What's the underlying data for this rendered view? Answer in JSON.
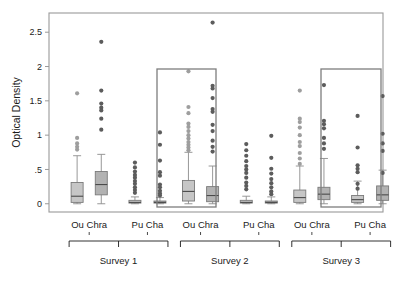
{
  "chart_data": {
    "type": "box",
    "title": "",
    "xlabel": "",
    "ylabel": "Optical Density",
    "ylim": [
      -0.12,
      2.78
    ],
    "yticks": [
      0,
      0.5,
      1,
      1.5,
      2,
      2.5
    ],
    "ytick_labels": [
      "0",
      ".5",
      "1",
      "1.5",
      "2",
      "2.5"
    ],
    "grid": false,
    "legend": "none",
    "group_labels": [
      "Ou Chra",
      "Pu Cha"
    ],
    "panel_labels": [
      "Survey 1",
      "Survey 2",
      "Survey 3"
    ],
    "highlight_boxes": [
      {
        "panel": "Survey 2",
        "group": "Ou Chra",
        "x0": 157,
        "y0": 69,
        "x1": 216,
        "y1": 207
      },
      {
        "panel": "Survey 3",
        "group": "Pu Cha",
        "x0": 321,
        "y0": 69,
        "x1": 381,
        "y1": 207
      }
    ],
    "series": [
      {
        "name": "Survey 1 / Ou Chra / A",
        "panel": "Survey 1",
        "group": "Ou Chra",
        "index": 0,
        "q1": 0.02,
        "median": 0.11,
        "q3": 0.31,
        "whisker_low": 0.0,
        "whisker_high": 0.7,
        "outliers": [
          1.61,
          0.96,
          0.88,
          0.83,
          0.79
        ]
      },
      {
        "name": "Survey 1 / Ou Chra / B",
        "panel": "Survey 1",
        "group": "Ou Chra",
        "index": 1,
        "q1": 0.13,
        "median": 0.28,
        "q3": 0.47,
        "whisker_low": 0.0,
        "whisker_high": 0.72,
        "outliers": [
          2.36,
          1.65,
          1.46,
          1.4,
          1.36,
          1.24,
          1.08
        ]
      },
      {
        "name": "Survey 1 / Pu Cha / A",
        "panel": "Survey 1",
        "group": "Pu Cha",
        "index": 2,
        "q1": 0.01,
        "median": 0.02,
        "q3": 0.05,
        "whisker_low": 0.0,
        "whisker_high": 0.1,
        "outliers": [
          0.6,
          0.53,
          0.47,
          0.42,
          0.38,
          0.33,
          0.29,
          0.24,
          0.2,
          0.16
        ]
      },
      {
        "name": "Survey 1 / Pu Cha / B",
        "panel": "Survey 1",
        "group": "Pu Cha",
        "index": 3,
        "q1": 0.01,
        "median": 0.02,
        "q3": 0.04,
        "whisker_low": 0.0,
        "whisker_high": 0.09,
        "outliers": [
          1.04,
          0.86,
          0.63,
          0.46,
          0.41,
          0.28,
          0.24,
          0.19,
          0.15,
          0.12
        ]
      },
      {
        "name": "Survey 2 / Ou Chra / A",
        "panel": "Survey 2",
        "group": "Ou Chra",
        "index": 0,
        "q1": 0.04,
        "median": 0.18,
        "q3": 0.34,
        "whisker_low": 0.0,
        "whisker_high": 0.75,
        "outliers": [
          1.93,
          1.41,
          1.32,
          1.17,
          1.12,
          1.06,
          1.0,
          0.95,
          0.9,
          0.86,
          0.82,
          0.78
        ]
      },
      {
        "name": "Survey 2 / Ou Chra / B",
        "panel": "Survey 2",
        "group": "Ou Chra",
        "index": 1,
        "q1": 0.03,
        "median": 0.12,
        "q3": 0.25,
        "whisker_low": 0.0,
        "whisker_high": 0.55,
        "outliers": [
          2.64,
          1.72,
          1.68,
          1.54,
          1.38,
          1.34,
          1.15,
          1.06,
          0.92,
          0.83,
          0.76
        ]
      },
      {
        "name": "Survey 2 / Pu Cha / A",
        "panel": "Survey 2",
        "group": "Pu Cha",
        "index": 2,
        "q1": 0.01,
        "median": 0.02,
        "q3": 0.05,
        "whisker_low": 0.0,
        "whisker_high": 0.11,
        "outliers": [
          0.87,
          0.78,
          0.7,
          0.62,
          0.55,
          0.5,
          0.45,
          0.38,
          0.31,
          0.26,
          0.21
        ]
      },
      {
        "name": "Survey 2 / Pu Cha / B",
        "panel": "Survey 2",
        "group": "Pu Cha",
        "index": 3,
        "q1": 0.01,
        "median": 0.02,
        "q3": 0.04,
        "whisker_low": 0.0,
        "whisker_high": 0.1,
        "outliers": [
          0.99,
          0.67,
          0.51,
          0.44,
          0.36,
          0.3,
          0.24,
          0.18,
          0.14
        ]
      },
      {
        "name": "Survey 3 / Ou Chra / A",
        "panel": "Survey 3",
        "group": "Ou Chra",
        "index": 0,
        "q1": 0.02,
        "median": 0.09,
        "q3": 0.2,
        "whisker_low": 0.0,
        "whisker_high": 0.55,
        "outliers": [
          1.65,
          1.24,
          1.19,
          1.11,
          1.0,
          0.9,
          0.84,
          0.74,
          0.66,
          0.58
        ]
      },
      {
        "name": "Survey 3 / Ou Chra / B",
        "panel": "Survey 3",
        "group": "Ou Chra",
        "index": 1,
        "q1": 0.06,
        "median": 0.14,
        "q3": 0.24,
        "whisker_low": 0.0,
        "whisker_high": 0.66,
        "outliers": [
          1.73,
          1.21,
          1.16,
          1.1,
          0.96,
          0.88,
          0.8
        ]
      },
      {
        "name": "Survey 3 / Pu Cha / A",
        "panel": "Survey 3",
        "group": "Pu Cha",
        "index": 2,
        "q1": 0.02,
        "median": 0.06,
        "q3": 0.12,
        "whisker_low": 0.0,
        "whisker_high": 0.33,
        "outliers": [
          1.28,
          0.82,
          0.56,
          0.51,
          0.46,
          0.29,
          0.22
        ]
      },
      {
        "name": "Survey 3 / Pu Cha / B",
        "panel": "Survey 3",
        "group": "Pu Cha",
        "index": 3,
        "q1": 0.05,
        "median": 0.13,
        "q3": 0.26,
        "whisker_low": 0.0,
        "whisker_high": 0.49,
        "outliers": [
          1.57,
          1.02,
          0.88,
          0.77,
          0.45
        ]
      }
    ],
    "colors": {
      "box_fill_light": "#c6c6c6",
      "box_fill_dark": "#b2b2b2",
      "box_stroke": "#7a7a7a",
      "median": "#4a4a4a",
      "outlier_light": "#9e9e9e",
      "outlier_dark": "#5c5c5c",
      "frame": "#9a9a9a",
      "highlight": "#7d7d7d",
      "text": "#1b1b1b",
      "background": "#ffffff"
    }
  }
}
